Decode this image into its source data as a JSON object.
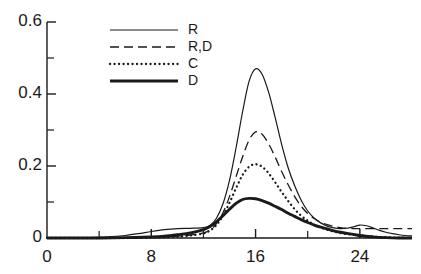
{
  "chart_data": {
    "type": "line",
    "title": "",
    "xlabel": "",
    "ylabel": "",
    "xlim": [
      0,
      28
    ],
    "ylim": [
      0,
      0.6
    ],
    "grid": false,
    "legend_position": "top-center",
    "x_ticks_major": [
      0,
      8,
      16,
      24
    ],
    "x_tick_labels": [
      "0",
      "8",
      "16",
      "24"
    ],
    "x_ticks_minor": [
      4,
      12,
      20
    ],
    "y_ticks_major": [
      0,
      0.2,
      0.4,
      0.6
    ],
    "y_tick_labels": [
      "0",
      "0.2",
      "0.4",
      "0.6"
    ],
    "y_ticks_minor": [
      0.1,
      0.3,
      0.5
    ],
    "series": [
      {
        "name": "R",
        "style": "solid-thin",
        "peak_x": 16,
        "peak_y": 0.47,
        "x": [
          0,
          1,
          2,
          3,
          4,
          5,
          6,
          7,
          8,
          9,
          10,
          11,
          12,
          12.5,
          13,
          13.5,
          14,
          14.5,
          15,
          15.5,
          16,
          16.5,
          17,
          17.5,
          18,
          18.5,
          19,
          19.5,
          20,
          20.5,
          21,
          21.5,
          22,
          22.5,
          23,
          23.5,
          24,
          24.5,
          25,
          25.5,
          26,
          26.5,
          27,
          27.5,
          28
        ],
        "y": [
          0.0,
          0.0,
          0.0,
          0.001,
          0.002,
          0.004,
          0.007,
          0.012,
          0.018,
          0.023,
          0.026,
          0.027,
          0.029,
          0.035,
          0.055,
          0.095,
          0.16,
          0.25,
          0.35,
          0.435,
          0.47,
          0.455,
          0.405,
          0.335,
          0.26,
          0.195,
          0.145,
          0.105,
          0.075,
          0.055,
          0.042,
          0.033,
          0.028,
          0.026,
          0.027,
          0.031,
          0.036,
          0.034,
          0.028,
          0.021,
          0.016,
          0.012,
          0.009,
          0.007,
          0.006
        ]
      },
      {
        "name": "R,D",
        "style": "dashed",
        "peak_x": 16,
        "peak_y": 0.295,
        "x": [
          0,
          2,
          4,
          6,
          8,
          9,
          10,
          11,
          12,
          12.5,
          13,
          13.5,
          14,
          14.5,
          15,
          15.5,
          16,
          16.5,
          17,
          17.5,
          18,
          18.5,
          19,
          19.5,
          20,
          20.5,
          21,
          21.5,
          22,
          22.5,
          23,
          23.5,
          24,
          25,
          26,
          27,
          28
        ],
        "y": [
          0.0,
          0.0,
          0.0,
          0.001,
          0.002,
          0.003,
          0.005,
          0.008,
          0.014,
          0.022,
          0.04,
          0.07,
          0.115,
          0.17,
          0.225,
          0.272,
          0.295,
          0.288,
          0.262,
          0.225,
          0.185,
          0.148,
          0.115,
          0.088,
          0.068,
          0.054,
          0.044,
          0.037,
          0.032,
          0.029,
          0.027,
          0.026,
          0.026,
          0.026,
          0.026,
          0.026,
          0.026
        ]
      },
      {
        "name": "C",
        "style": "dotted",
        "peak_x": 16,
        "peak_y": 0.205,
        "x": [
          0,
          2,
          4,
          6,
          8,
          9,
          10,
          11,
          12,
          12.5,
          13,
          13.5,
          14,
          14.5,
          15,
          15.5,
          16,
          16.5,
          17,
          17.5,
          18,
          18.5,
          19,
          19.5,
          20,
          20.5,
          21,
          21.5,
          22,
          22.5,
          23,
          23.5,
          24,
          25,
          26,
          27,
          28
        ],
        "y": [
          0.0,
          0.0,
          0.0,
          0.0,
          0.001,
          0.002,
          0.004,
          0.007,
          0.013,
          0.021,
          0.036,
          0.062,
          0.098,
          0.138,
          0.175,
          0.198,
          0.205,
          0.198,
          0.18,
          0.155,
          0.128,
          0.103,
          0.08,
          0.062,
          0.048,
          0.037,
          0.029,
          0.023,
          0.018,
          0.014,
          0.011,
          0.009,
          0.007,
          0.004,
          0.002,
          0.001,
          0.0
        ]
      },
      {
        "name": "D",
        "style": "solid-thick",
        "peak_x": 15.5,
        "peak_y": 0.11,
        "x": [
          0,
          2,
          4,
          6,
          8,
          9,
          10,
          11,
          12,
          12.5,
          13,
          13.5,
          14,
          14.5,
          15,
          15.5,
          16,
          16.5,
          17,
          17.5,
          18,
          18.5,
          19,
          19.5,
          20,
          20.5,
          21,
          21.5,
          22,
          22.5,
          23,
          23.5,
          24,
          24.5,
          25,
          26,
          27,
          28
        ],
        "y": [
          0.0,
          0.0,
          0.0,
          0.001,
          0.003,
          0.005,
          0.009,
          0.014,
          0.023,
          0.032,
          0.045,
          0.062,
          0.08,
          0.096,
          0.107,
          0.11,
          0.109,
          0.104,
          0.097,
          0.088,
          0.079,
          0.069,
          0.06,
          0.051,
          0.043,
          0.036,
          0.03,
          0.025,
          0.02,
          0.016,
          0.013,
          0.01,
          0.007,
          0.005,
          0.003,
          0.001,
          0.0,
          0.0
        ]
      }
    ],
    "legend": [
      {
        "label": "R",
        "style": "solid-thin"
      },
      {
        "label": "R,D",
        "style": "dashed"
      },
      {
        "label": "C",
        "style": "dotted"
      },
      {
        "label": "D",
        "style": "solid-thick"
      }
    ],
    "colors": {
      "axis": "#1a1a1a",
      "line": "#1a1a1a",
      "background": "#ffffff"
    }
  }
}
